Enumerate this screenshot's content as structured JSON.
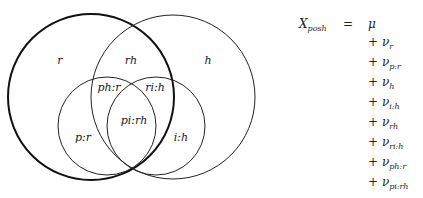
{
  "diagram": {
    "type": "venn",
    "sets": [
      {
        "id": "r",
        "emphasis": "bold"
      },
      {
        "id": "h",
        "emphasis": "normal"
      },
      {
        "id": "p",
        "emphasis": "normal"
      },
      {
        "id": "i",
        "emphasis": "normal"
      }
    ],
    "region_labels": {
      "r": "r",
      "rh": "rh",
      "h": "h",
      "ph_r": "ph:r",
      "ri_h": "ri:h",
      "pi_rh": "pi:rh",
      "p_r": "p:r",
      "i_h": "i:h"
    }
  },
  "equation": {
    "lhs_symbol": "X",
    "lhs_subscript": "posh",
    "equals": "=",
    "first_term": "μ",
    "terms": [
      {
        "op": "+",
        "symbol": "ν",
        "subscript": "r"
      },
      {
        "op": "+",
        "symbol": "ν",
        "subscript": "p:r"
      },
      {
        "op": "+",
        "symbol": "ν",
        "subscript": "h"
      },
      {
        "op": "+",
        "symbol": "ν",
        "subscript": "i:h"
      },
      {
        "op": "+",
        "symbol": "ν",
        "subscript": "rh"
      },
      {
        "op": "+",
        "symbol": "ν",
        "subscript": "ri:h"
      },
      {
        "op": "+",
        "symbol": "ν",
        "subscript": "ph:r"
      },
      {
        "op": "+",
        "symbol": "ν",
        "subscript": "pi:rh"
      }
    ]
  }
}
